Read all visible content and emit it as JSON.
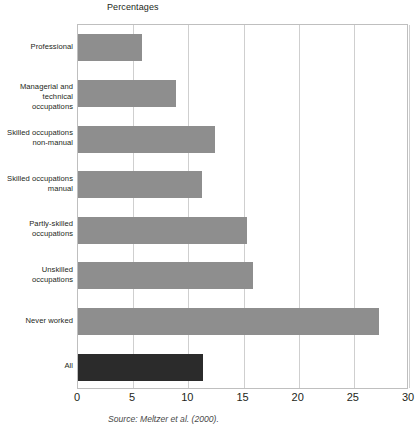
{
  "chart_data": {
    "type": "bar",
    "orientation": "horizontal",
    "title": "Percentages",
    "xlabel": "",
    "ylabel": "",
    "xlim": [
      0,
      30
    ],
    "xticks": [
      0,
      5,
      10,
      15,
      20,
      25,
      30
    ],
    "xtick_labels": [
      "0",
      "5",
      "10",
      "15",
      "20",
      "25",
      "30"
    ],
    "grid": true,
    "legend": null,
    "source": "Source: Meltzer et al. (2000).",
    "categories": [
      "Professional",
      "Managerial and\ntechnical occupations",
      "Skilled occupations\nnon-manual",
      "Skilled occupations\nmanual",
      "Partly-skilled\noccupations",
      "Unskilled\noccupations",
      "Never worked",
      "All"
    ],
    "values": [
      5.8,
      8.9,
      12.4,
      11.2,
      15.3,
      15.9,
      27.3,
      11.3
    ],
    "bar_colors": [
      "#8e8e8e",
      "#8e8e8e",
      "#8e8e8e",
      "#8e8e8e",
      "#8e8e8e",
      "#8e8e8e",
      "#8e8e8e",
      "#2b2b2b"
    ]
  },
  "categories_display": [
    {
      "line1": "Professional",
      "line2": ""
    },
    {
      "line1": "Managerial and",
      "line2": "technical occupations"
    },
    {
      "line1": "Skilled occupations",
      "line2": "non-manual"
    },
    {
      "line1": "Skilled occupations",
      "line2": "manual"
    },
    {
      "line1": "Partly-skilled",
      "line2": "occupations"
    },
    {
      "line1": "Unskilled",
      "line2": "occupations"
    },
    {
      "line1": "Never worked",
      "line2": ""
    },
    {
      "line1": "All",
      "line2": ""
    }
  ],
  "colors": {
    "bar_default": "#8e8e8e",
    "bar_highlight": "#2b2b2b",
    "gridline": "#cfcfcf",
    "frame": "#bfbfbf",
    "text": "#231f20",
    "source_text": "#4a4a4a"
  }
}
